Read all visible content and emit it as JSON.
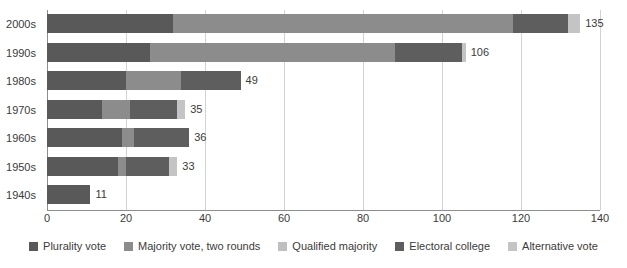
{
  "chart_data": {
    "type": "bar",
    "orientation": "horizontal",
    "stacked": true,
    "title": "",
    "subtitle": "",
    "xlabel": "",
    "ylabel": "",
    "xlim": [
      0,
      140
    ],
    "ylim": null,
    "grid": true,
    "legend_position": "bottom",
    "xticks": [
      "0",
      "20",
      "40",
      "60",
      "80",
      "100",
      "120",
      "140"
    ],
    "xtick_values": [
      0,
      20,
      40,
      60,
      80,
      100,
      120,
      140
    ],
    "categories": [
      "2000s",
      "1990s",
      "1980s",
      "1970s",
      "1960s",
      "1950s",
      "1940s"
    ],
    "series": [
      {
        "name": "Plurality vote",
        "color": "#595959",
        "values": [
          32,
          26,
          20,
          14,
          19,
          18,
          11
        ]
      },
      {
        "name": "Majority vote, two rounds",
        "color": "#8c8c8c",
        "values": [
          86,
          62,
          14,
          7,
          3,
          2,
          0
        ]
      },
      {
        "name": "Qualified majority",
        "color": "#bfbfbf",
        "values": [
          0,
          0,
          0,
          0,
          0,
          0,
          0
        ]
      },
      {
        "name": "Electoral college",
        "color": "#5e5e5e",
        "values": [
          14,
          17,
          15,
          12,
          14,
          11,
          0
        ]
      },
      {
        "name": "Alternative vote",
        "color": "#c4c4c4",
        "values": [
          3,
          1,
          0,
          2,
          0,
          2,
          0
        ]
      }
    ],
    "totals": [
      135,
      106,
      49,
      35,
      36,
      33,
      11
    ],
    "total_labels": [
      "135",
      "106",
      "49",
      "35",
      "36",
      "33",
      "11"
    ]
  },
  "legend": {
    "items": [
      {
        "label": "Plurality vote"
      },
      {
        "label": "Majority vote, two rounds"
      },
      {
        "label": "Qualified majority"
      },
      {
        "label": "Electoral college"
      },
      {
        "label": "Alternative vote"
      }
    ]
  },
  "colors": {
    "background": "#ffffff",
    "text": "#3b3b3b",
    "gridline": "#d2d2d2",
    "axis": "#8d8d8d"
  }
}
